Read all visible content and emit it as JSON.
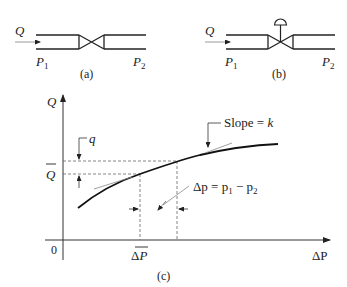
{
  "figure_a": {
    "flow_label": "Q",
    "inlet_pressure": "P",
    "inlet_sub": "1",
    "outlet_pressure": "P",
    "outlet_sub": "2",
    "caption": "(a)"
  },
  "figure_b": {
    "flow_label": "Q",
    "inlet_pressure": "P",
    "inlet_sub": "1",
    "outlet_pressure": "P",
    "outlet_sub": "2",
    "caption": "(b)"
  },
  "figure_c": {
    "y_axis_label": "Q",
    "x_axis_label": "ΔP",
    "origin_label": "0",
    "q_label": "q",
    "qbar_label": "Q",
    "dpbar_label_prefix": "Δ",
    "dpbar_label_var": "P",
    "slope_label": "Slope = ",
    "slope_var": "k",
    "dp_eq_prefix": "Δp = p",
    "dp_eq_sub1": "1",
    "dp_eq_mid": " − p",
    "dp_eq_sub2": "2",
    "caption": "(c)"
  },
  "colors": {
    "line": "#222222",
    "dashed": "#666666",
    "tangent": "#888888"
  }
}
